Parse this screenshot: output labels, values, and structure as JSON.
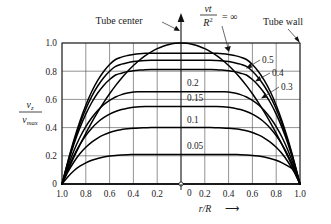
{
  "figure": {
    "background_color": "#ffffff",
    "ink_color": "#000000",
    "grid_color": "#4a4a4a"
  },
  "annotations": {
    "tube_center": "Tube center",
    "tube_wall": "Tube wall",
    "parameter_numerator": "νt",
    "parameter_denominator": "R",
    "parameter_denominator_exponent": "2",
    "parameter_equals": "= ∞"
  },
  "axes": {
    "x_label_symbol": "r/R",
    "x_label_arrow": "⟶",
    "y_label_numerator_symbol": "v",
    "y_label_numerator_sub": "z",
    "y_label_denominator_symbol": "v",
    "y_label_denominator_sub": "max",
    "x_ticklabels_left": [
      "1.0",
      "0.8",
      "0.6",
      "0.4",
      "0.2"
    ],
    "x_ticklabels_right": [
      "0.2",
      "0.4",
      "0.6",
      "0.8",
      "1.0"
    ],
    "x_center_tick": "",
    "y_ticklabels": [
      "1.0",
      "0.8",
      "0.6",
      "0.4",
      "0.2",
      "0"
    ]
  },
  "chart_data": {
    "type": "line",
    "title": "",
    "subtitle": "",
    "xlabel": "r/R",
    "ylabel": "v_z / v_max",
    "xlim": [
      -1.0,
      1.0
    ],
    "ylim": [
      0.0,
      1.0
    ],
    "x_axis_is_symmetric": true,
    "x_tick_values": [
      -1.0,
      -0.8,
      -0.6,
      -0.4,
      -0.2,
      0.0,
      0.2,
      0.4,
      0.6,
      0.8,
      1.0
    ],
    "y_tick_values": [
      0.0,
      0.2,
      0.4,
      0.6,
      0.8,
      1.0
    ],
    "grid": true,
    "legend": "inline-curve-labels",
    "legend_position": "inline",
    "series_parameter_name": "νt/R²",
    "x": [
      -1.0,
      -0.95,
      -0.9,
      -0.85,
      -0.8,
      -0.75,
      -0.7,
      -0.65,
      -0.6,
      -0.55,
      -0.5,
      -0.45,
      -0.4,
      -0.35,
      -0.3,
      -0.25,
      -0.2,
      -0.15,
      -0.1,
      -0.05,
      0.0,
      0.05,
      0.1,
      0.15,
      0.2,
      0.25,
      0.3,
      0.35,
      0.4,
      0.45,
      0.5,
      0.55,
      0.6,
      0.65,
      0.7,
      0.75,
      0.8,
      0.85,
      0.9,
      0.95,
      1.0
    ],
    "series": [
      {
        "name": "0",
        "label": "0",
        "peak": 0.0,
        "label_position": "inner-center",
        "values": [
          0,
          0,
          0,
          0,
          0,
          0,
          0,
          0,
          0,
          0,
          0,
          0,
          0,
          0,
          0,
          0,
          0,
          0,
          0,
          0,
          0,
          0,
          0,
          0,
          0,
          0,
          0,
          0,
          0,
          0,
          0,
          0,
          0,
          0,
          0,
          0,
          0,
          0,
          0,
          0,
          0
        ]
      },
      {
        "name": "0.05",
        "label": "0.05",
        "peak": 0.21,
        "label_position": "inner-center",
        "values": [
          0.0,
          0.052,
          0.094,
          0.126,
          0.15,
          0.168,
          0.181,
          0.191,
          0.198,
          0.203,
          0.206,
          0.208,
          0.209,
          0.21,
          0.21,
          0.21,
          0.21,
          0.21,
          0.21,
          0.21,
          0.21,
          0.21,
          0.21,
          0.21,
          0.21,
          0.21,
          0.21,
          0.21,
          0.21,
          0.209,
          0.208,
          0.206,
          0.203,
          0.198,
          0.191,
          0.181,
          0.168,
          0.15,
          0.126,
          0.094,
          0.0
        ]
      },
      {
        "name": "0.1",
        "label": "0.1",
        "peak": 0.4,
        "label_position": "inner-center",
        "values": [
          0.0,
          0.086,
          0.156,
          0.214,
          0.26,
          0.297,
          0.326,
          0.348,
          0.365,
          0.378,
          0.386,
          0.392,
          0.396,
          0.398,
          0.399,
          0.4,
          0.4,
          0.4,
          0.4,
          0.4,
          0.4,
          0.4,
          0.4,
          0.4,
          0.4,
          0.4,
          0.399,
          0.398,
          0.396,
          0.392,
          0.386,
          0.378,
          0.365,
          0.348,
          0.326,
          0.297,
          0.26,
          0.214,
          0.156,
          0.086,
          0.0
        ]
      },
      {
        "name": "0.15",
        "label": "0.15",
        "peak": 0.55,
        "label_position": "inner-center",
        "values": [
          0.0,
          0.109,
          0.202,
          0.28,
          0.344,
          0.396,
          0.438,
          0.47,
          0.495,
          0.514,
          0.528,
          0.538,
          0.544,
          0.548,
          0.55,
          0.55,
          0.55,
          0.55,
          0.55,
          0.55,
          0.55,
          0.55,
          0.55,
          0.55,
          0.55,
          0.55,
          0.55,
          0.548,
          0.544,
          0.538,
          0.528,
          0.514,
          0.495,
          0.47,
          0.438,
          0.396,
          0.344,
          0.28,
          0.202,
          0.109,
          0.0
        ]
      },
      {
        "name": "0.2",
        "label": "0.2",
        "peak": 0.655,
        "label_position": "inner-center",
        "values": [
          0.0,
          0.126,
          0.236,
          0.33,
          0.407,
          0.47,
          0.522,
          0.562,
          0.593,
          0.617,
          0.634,
          0.645,
          0.652,
          0.654,
          0.655,
          0.655,
          0.655,
          0.655,
          0.655,
          0.655,
          0.655,
          0.655,
          0.655,
          0.655,
          0.655,
          0.655,
          0.655,
          0.654,
          0.652,
          0.645,
          0.634,
          0.617,
          0.593,
          0.562,
          0.522,
          0.47,
          0.407,
          0.33,
          0.236,
          0.126,
          0.0
        ]
      },
      {
        "name": "0.3",
        "label": "0.3",
        "peak": 0.812,
        "label_position": "right-leader",
        "values": [
          0.0,
          0.148,
          0.282,
          0.398,
          0.496,
          0.578,
          0.645,
          0.699,
          0.741,
          0.773,
          0.786,
          0.797,
          0.804,
          0.808,
          0.811,
          0.812,
          0.812,
          0.812,
          0.812,
          0.812,
          0.812,
          0.812,
          0.812,
          0.812,
          0.812,
          0.812,
          0.811,
          0.808,
          0.804,
          0.797,
          0.786,
          0.773,
          0.741,
          0.699,
          0.645,
          0.578,
          0.496,
          0.398,
          0.282,
          0.148,
          0.0
        ]
      },
      {
        "name": "0.4",
        "label": "0.4",
        "peak": 0.878,
        "label_position": "right-leader",
        "values": [
          0.0,
          0.156,
          0.299,
          0.424,
          0.532,
          0.622,
          0.695,
          0.754,
          0.8,
          0.834,
          0.85,
          0.86,
          0.868,
          0.873,
          0.876,
          0.878,
          0.878,
          0.878,
          0.878,
          0.878,
          0.878,
          0.878,
          0.878,
          0.878,
          0.878,
          0.878,
          0.876,
          0.873,
          0.868,
          0.86,
          0.85,
          0.834,
          0.8,
          0.754,
          0.695,
          0.622,
          0.532,
          0.424,
          0.299,
          0.156,
          0.0
        ]
      },
      {
        "name": "0.5",
        "label": "0.5",
        "peak": 0.928,
        "label_position": "right-leader",
        "values": [
          0.0,
          0.162,
          0.312,
          0.444,
          0.559,
          0.656,
          0.735,
          0.798,
          0.848,
          0.883,
          0.9,
          0.911,
          0.919,
          0.924,
          0.927,
          0.928,
          0.928,
          0.928,
          0.928,
          0.928,
          0.928,
          0.928,
          0.928,
          0.928,
          0.928,
          0.928,
          0.927,
          0.924,
          0.919,
          0.911,
          0.9,
          0.883,
          0.848,
          0.798,
          0.735,
          0.656,
          0.559,
          0.444,
          0.312,
          0.162,
          0.0
        ]
      },
      {
        "name": "∞",
        "label": "∞",
        "peak": 1.0,
        "label_position": "top-leader",
        "values": [
          0.0,
          0.0975,
          0.19,
          0.2775,
          0.36,
          0.4375,
          0.51,
          0.5775,
          0.64,
          0.6975,
          0.75,
          0.7975,
          0.84,
          0.8775,
          0.91,
          0.9375,
          0.96,
          0.9775,
          0.99,
          0.9975,
          1.0,
          0.9975,
          0.99,
          0.9775,
          0.96,
          0.9375,
          0.91,
          0.8775,
          0.84,
          0.7975,
          0.75,
          0.6975,
          0.64,
          0.5775,
          0.51,
          0.4375,
          0.36,
          0.2775,
          0.19,
          0.0975,
          0.0
        ]
      }
    ]
  }
}
